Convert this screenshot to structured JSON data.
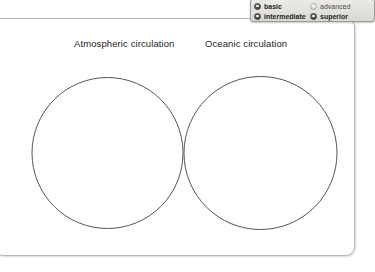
{
  "diagram": {
    "type": "venn",
    "left_circle_label": "Atmospheric circulation",
    "right_circle_label": "Oceanic circulation",
    "stroke_color": "#555555",
    "fill_color": "#ffffff"
  },
  "level_panel": {
    "options": [
      {
        "label": "basic",
        "selected": true,
        "icon": "radio-selected-icon"
      },
      {
        "label": "advanced",
        "selected": false,
        "icon": "radio-unselected-icon"
      },
      {
        "label": "intermediate",
        "selected": true,
        "icon": "radio-selected-icon"
      },
      {
        "label": "superior",
        "selected": true,
        "icon": "radio-selected-icon"
      }
    ]
  },
  "colors": {
    "panel_border": "#b8b8b8",
    "level_panel_border": "#9a9a96",
    "text": "#1d1d1d"
  }
}
